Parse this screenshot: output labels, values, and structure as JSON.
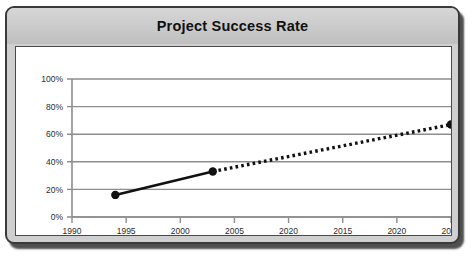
{
  "chart": {
    "title": "Project Success Rate"
  },
  "chart_data": {
    "type": "line",
    "title": "Project Success Rate",
    "xlabel": "",
    "ylabel": "",
    "grid": true,
    "legend": false,
    "xlim": [
      1990,
      2025
    ],
    "ylim": [
      0,
      100
    ],
    "y_tick_labels": [
      "0%",
      "20%",
      "40%",
      "60%",
      "80%",
      "100%"
    ],
    "y_tick_values": [
      0,
      20,
      40,
      60,
      80,
      100
    ],
    "x_tick_labels": [
      "1990",
      "1995",
      "2000",
      "2005",
      "2020",
      "2015",
      "2020",
      "2025"
    ],
    "x_tick_positions": [
      1990,
      1995,
      2000,
      2005,
      2010,
      2015,
      2020,
      2025
    ],
    "series": [
      {
        "name": "Project Success Rate",
        "x": [
          1994,
          2003,
          2025
        ],
        "values": [
          16,
          33,
          67
        ],
        "marker": "circle",
        "color": "#111111",
        "segments": [
          {
            "from_index": 0,
            "to_index": 1,
            "style": "solid"
          },
          {
            "from_index": 1,
            "to_index": 2,
            "style": "dotted"
          }
        ]
      }
    ],
    "points": [
      {
        "x": 1994,
        "y": 16,
        "label": "16%"
      },
      {
        "x": 2003,
        "y": 33,
        "label": "33%"
      },
      {
        "x": 2025,
        "y": 67,
        "label": "67%"
      }
    ]
  },
  "colors": {
    "line": "#111111",
    "marker": "#111111",
    "grid": "#8d8d8d",
    "axis": "#8d8d8d",
    "frame_border": "#3a3a3a",
    "header_band": "#cccccc",
    "plot_background": "#ffffff"
  }
}
